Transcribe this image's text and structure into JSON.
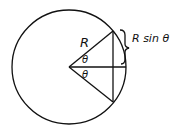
{
  "diagram": {
    "labels": {
      "radius": "R",
      "angle_upper": "θ",
      "angle_lower": "θ",
      "brace_label": "R sin θ"
    },
    "geometry": {
      "circle": {
        "cx": 69,
        "cy": 67,
        "r": 57
      },
      "vertex": [
        69,
        67
      ],
      "upper_point": [
        113,
        31
      ],
      "lower_point": [
        113,
        102
      ],
      "horizontal_end": [
        126,
        67
      ]
    },
    "colors": {
      "stroke": "#111111",
      "background": "#ffffff"
    }
  }
}
